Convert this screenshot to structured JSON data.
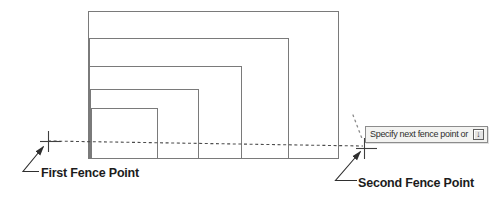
{
  "figure": {
    "rectangles": [
      {
        "x": 88,
        "y": 11,
        "w": 250,
        "h": 147
      },
      {
        "x": 89,
        "y": 38,
        "w": 199,
        "h": 120
      },
      {
        "x": 89,
        "y": 66,
        "w": 152,
        "h": 92
      },
      {
        "x": 90,
        "y": 89,
        "w": 108,
        "h": 69
      },
      {
        "x": 91,
        "y": 108,
        "w": 66,
        "h": 50
      }
    ],
    "fence_line": {
      "x1": 48,
      "y1": 141,
      "x2": 363,
      "y2": 146
    },
    "cursor_trail": {
      "x1": 353,
      "y1": 115,
      "x2": 363,
      "y2": 141
    },
    "fence_points": [
      {
        "id": "first-fence-point",
        "x": 48,
        "y": 141
      },
      {
        "id": "second-fence-point",
        "x": 364,
        "y": 148
      }
    ]
  },
  "annotations": {
    "first_fence_label": "First Fence Point",
    "second_fence_label": "Second Fence Point"
  },
  "tooltip": {
    "text": "Specify next fence point or",
    "key_glyph": "↓",
    "key_icon": "down-arrow-key-icon"
  },
  "colors": {
    "rect_stroke": "#7a7a7a",
    "fence_stroke": "#4d4d4d",
    "trail_stroke": "#8a8a8a",
    "marker_stroke": "#3f3f3f",
    "leader_stroke": "#2f2f2f",
    "label_text": "#1c1c1c",
    "tooltip_bg": "#f3f3f1",
    "tooltip_border": "#8c8c8c",
    "tooltip_text": "#2e2e2e",
    "keycap_border": "#5f5f5f",
    "keycap_bg": "#e4e4e4"
  }
}
